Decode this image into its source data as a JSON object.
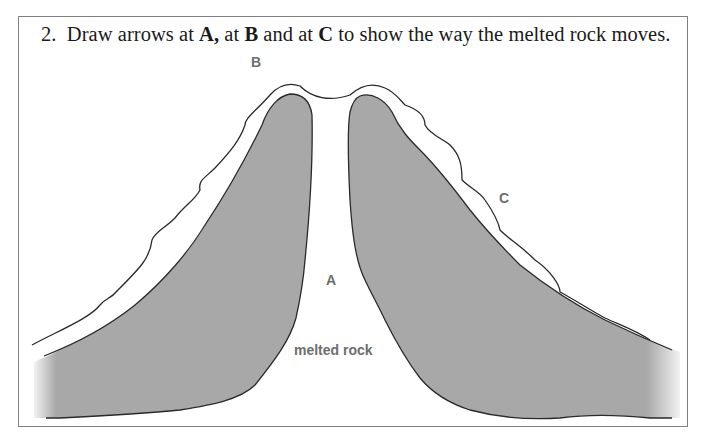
{
  "question": {
    "number": "2.",
    "parts": [
      {
        "text": "Draw arrows at ",
        "bold": false
      },
      {
        "text": "A,",
        "bold": true
      },
      {
        "text": " at ",
        "bold": false
      },
      {
        "text": "B",
        "bold": true
      },
      {
        "text": " and at ",
        "bold": false
      },
      {
        "text": "C",
        "bold": true
      },
      {
        "text": " to show the way the melted rock moves.",
        "bold": false
      }
    ]
  },
  "diagram": {
    "labels": {
      "A": "A",
      "B": "B",
      "C": "C",
      "magma": "melted rock"
    },
    "colors": {
      "rock_fill": "#a8a8a8",
      "outline": "#2a2a2a",
      "label": "#6e6e6e",
      "frame": "#808080"
    }
  }
}
